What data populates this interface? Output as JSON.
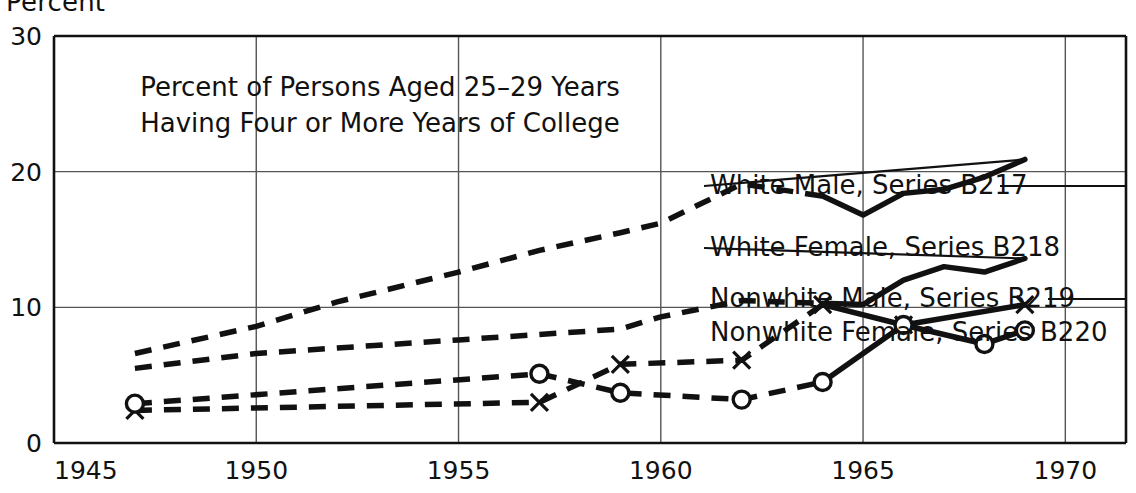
{
  "axis_unit_label": "Percent",
  "chart_data": {
    "type": "line",
    "title_lines": [
      "Percent of Persons Aged 25–29 Years",
      "Having Four or More Years of College"
    ],
    "xlabel": "",
    "ylabel": "Percent",
    "xlim": [
      1945,
      1971.5
    ],
    "ylim": [
      0,
      30
    ],
    "xticks": [
      1945,
      1950,
      1955,
      1960,
      1965,
      1970
    ],
    "xtick_labels": [
      "1945",
      "1950",
      "1955",
      "1960",
      "1965",
      "1970"
    ],
    "yticks": [
      0,
      10,
      20,
      30
    ],
    "ytick_labels": [
      "0",
      "10",
      "20",
      "30"
    ],
    "grid": "horizontal gridlines at 10 and 20 extend full width; vertical gridlines at each 5-year tick inside plot",
    "legend_position": "right, inline labels with leader lines",
    "series": [
      {
        "name": "White Male, Series B217",
        "label": "White Male, Series B217",
        "style": "dashed-then-solid",
        "marker": "none",
        "dashed_until": 1964,
        "leader_line": true,
        "x": [
          1947,
          1950,
          1952,
          1955,
          1957,
          1959,
          1960,
          1962,
          1964,
          1965,
          1966,
          1967,
          1968,
          1969
        ],
        "y": [
          6.6,
          8.6,
          10.4,
          12.6,
          14.2,
          15.5,
          16.2,
          19.1,
          18.2,
          16.8,
          18.4,
          18.7,
          19.6,
          20.9
        ]
      },
      {
        "name": "White Female, Series B218",
        "label": "White Female, Series B218",
        "style": "dashed-then-solid",
        "marker": "none",
        "dashed_until": 1964,
        "leader_line": false,
        "x": [
          1947,
          1950,
          1952,
          1955,
          1957,
          1959,
          1960,
          1962,
          1964,
          1965,
          1966,
          1967,
          1968,
          1969
        ],
        "y": [
          5.5,
          6.6,
          7.0,
          7.6,
          8.0,
          8.4,
          9.3,
          10.5,
          10.3,
          10.2,
          12.0,
          13.0,
          12.6,
          13.6
        ]
      },
      {
        "name": "Nonwhite Male, Series B219",
        "label": "Nonwhite Male, Series B219",
        "style": "dashed-then-solid",
        "marker": "x",
        "dashed_until": 1964,
        "leader_line": true,
        "x": [
          1947,
          1957,
          1959,
          1962,
          1964,
          1966,
          1969
        ],
        "y": [
          2.4,
          3.0,
          5.8,
          6.1,
          10.2,
          8.7,
          10.2
        ]
      },
      {
        "name": "Nonwhite Female, Series B220",
        "label": "Nonwhite Female, Series B220",
        "style": "dashed-then-solid",
        "marker": "o",
        "dashed_until": 1964,
        "leader_line": false,
        "x": [
          1947,
          1957,
          1959,
          1962,
          1964,
          1966,
          1968,
          1969
        ],
        "y": [
          2.9,
          5.1,
          3.7,
          3.2,
          4.5,
          8.7,
          7.3,
          8.3
        ]
      }
    ]
  },
  "colors": {
    "ink": "#111111",
    "background": "#ffffff",
    "grid": "#555555"
  }
}
